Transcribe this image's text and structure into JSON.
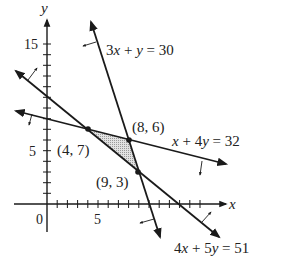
{
  "figure": {
    "type": "linear-programming-feasible-region",
    "axes": {
      "x_label": "x",
      "y_label": "y",
      "origin_label": "0",
      "x_tick_labels": [
        {
          "value": 5,
          "label": "5"
        }
      ],
      "y_tick_labels": [
        {
          "value": 5,
          "label": "5"
        },
        {
          "value": 15,
          "label": "15"
        }
      ],
      "x_minor_ticks": [
        1,
        2,
        3,
        4,
        5,
        6,
        7,
        8,
        9,
        10,
        11,
        12
      ],
      "y_minor_ticks": [
        1,
        2,
        3,
        4,
        5,
        6,
        7,
        8,
        9,
        10,
        11,
        12,
        13,
        14,
        15
      ]
    },
    "lines": [
      {
        "id": "l1",
        "equation_parts": [
          "3",
          "x",
          " + ",
          "y",
          " = 30"
        ],
        "label": "3x + y = 30"
      },
      {
        "id": "l2",
        "equation_parts": [
          "",
          "x",
          " + 4",
          "y",
          " = 32"
        ],
        "label": "x + 4y = 32"
      },
      {
        "id": "l3",
        "equation_parts": [
          "4",
          "x",
          " + 5",
          "y",
          " = 51"
        ],
        "label": "4x + 5y = 51"
      }
    ],
    "vertices": [
      {
        "label": "(4, 7)",
        "x": 4,
        "y": 7
      },
      {
        "label": "(8, 6)",
        "x": 8,
        "y": 6
      },
      {
        "label": "(9, 3)",
        "x": 9,
        "y": 3
      }
    ],
    "feasible_region": {
      "fill": "shaded-gray",
      "vertices": [
        "(4, 7)",
        "(8, 6)",
        "(9, 3)"
      ]
    },
    "colors": {
      "line": "#1a1a1a",
      "shade": "#c8c8c8",
      "text": "#222222"
    }
  }
}
